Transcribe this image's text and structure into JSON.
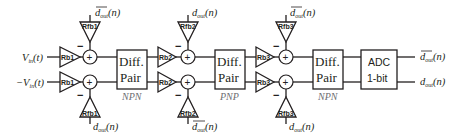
{
  "inputs": {
    "top": "V",
    "top_sub": "in",
    "top_arg": "(t)",
    "bottom_prefix": "−V",
    "bottom_sub": "in",
    "bottom_arg": "(t)"
  },
  "stages": [
    {
      "input_gain_label": "Rb1",
      "feedback_gain_label": "Rfb1",
      "feedback_top_signal": {
        "base": "d",
        "sub": "out",
        "arg": "(n)",
        "overline": true
      },
      "feedback_bottom_signal": {
        "base": "d",
        "sub": "out",
        "arg": "(n)",
        "overline": false
      },
      "diff_pair_line1": "Diff.",
      "diff_pair_line2": "Pair",
      "transistor_type": "NPN"
    },
    {
      "input_gain_label": "Rb2",
      "feedback_gain_label": "Rfb2",
      "feedback_top_signal": {
        "base": "d",
        "sub": "out",
        "arg": "(n)",
        "overline": false
      },
      "feedback_bottom_signal": {
        "base": "d",
        "sub": "out",
        "arg": "(n)",
        "overline": true
      },
      "diff_pair_line1": "Diff.",
      "diff_pair_line2": "Pair",
      "transistor_type": "PNP"
    },
    {
      "input_gain_label": "Rb3",
      "feedback_gain_label": "Rfb3",
      "feedback_top_signal": {
        "base": "d",
        "sub": "out",
        "arg": "(n)",
        "overline": true
      },
      "feedback_bottom_signal": {
        "base": "d",
        "sub": "out",
        "arg": "(n)",
        "overline": false
      },
      "diff_pair_line1": "Diff.",
      "diff_pair_line2": "Pair",
      "transistor_type": "NPN"
    }
  ],
  "summer": {
    "plus": "+",
    "minus": "−"
  },
  "adc": {
    "line1": "ADC",
    "line2": "1-bit"
  },
  "outputs": {
    "top": {
      "base": "d",
      "sub": "out",
      "arg": "(n)",
      "overline": true
    },
    "bottom": {
      "base": "d",
      "sub": "out",
      "arg": "(n)",
      "overline": false
    }
  }
}
